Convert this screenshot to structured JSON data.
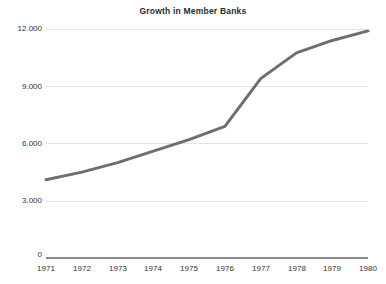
{
  "chart_data": {
    "type": "line",
    "title": "Growth in Member Banks",
    "xlabel": "",
    "ylabel": "",
    "categories": [
      "1971",
      "1972",
      "1973",
      "1974",
      "1975",
      "1976",
      "1977",
      "1978",
      "1979",
      "1980"
    ],
    "x": [
      1971,
      1972,
      1973,
      1974,
      1975,
      1976,
      1977,
      1978,
      1979,
      1980
    ],
    "values": [
      4100,
      4500,
      5000,
      5600,
      6200,
      6900,
      9400,
      10750,
      11400,
      11900
    ],
    "series": [
      {
        "name": "Member Banks",
        "values": [
          4100,
          4500,
          5000,
          5600,
          6200,
          6900,
          9400,
          10750,
          11400,
          11900
        ],
        "color": "#6e6e6e"
      }
    ],
    "ylim": [
      0,
      12000
    ],
    "xlim": [
      1971,
      1980
    ],
    "yticks": [
      0,
      3000,
      6000,
      9000,
      12000
    ],
    "ytick_labels": [
      "0",
      "3.000",
      "6.000",
      "9.000",
      "12.000"
    ],
    "xtick_labels": [
      "1971",
      "1972",
      "1973",
      "1974",
      "1975",
      "1976",
      "1977",
      "1978",
      "1979",
      "1980"
    ],
    "grid": true,
    "grid_color": "#e3e3e3",
    "legend": false,
    "legend_position": "none",
    "axis_color": "#8a8a8a",
    "line_color": "#6e6e6e",
    "line_width": 3,
    "background": "#ffffff",
    "annotations": []
  }
}
